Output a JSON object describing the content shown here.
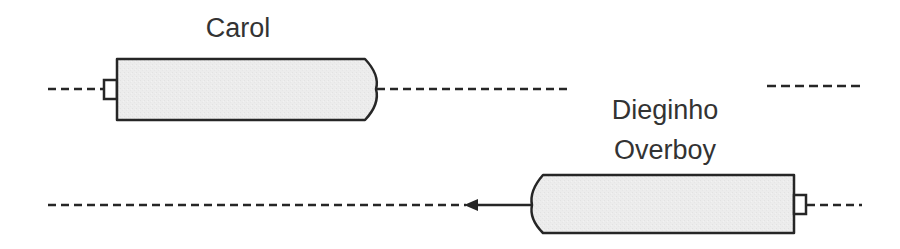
{
  "diagram": {
    "type": "sequence-timeline",
    "colors": {
      "stroke": "#262626",
      "fill": "#ebebeb",
      "text": "#333333"
    },
    "lanes": [
      {
        "label": "Carol",
        "label_lines": [
          "Carol"
        ],
        "bar_direction": "right",
        "has_arrow": false
      },
      {
        "label": "Dieginho Overboy",
        "label_lines": [
          "Dieginho",
          "Overboy"
        ],
        "bar_direction": "left",
        "has_arrow": true,
        "arrow_direction": "left"
      }
    ]
  }
}
